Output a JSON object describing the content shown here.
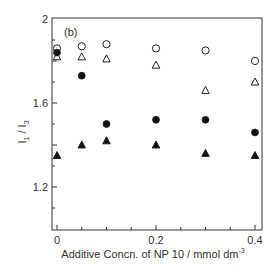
{
  "chart_data": {
    "type": "scatter",
    "panel_label": "(b)",
    "xlabel": "Additive Concn. of NP 10 / mmol dm-3",
    "xlabel_main": "Additive Concn. of NP 10 / mmol dm",
    "xlabel_sup": "-3",
    "ylabel": "I1 / I3",
    "xlim": [
      0,
      0.4
    ],
    "ylim": [
      1.0,
      2.0
    ],
    "x_ticks": [
      "0",
      "0.2",
      "0.4"
    ],
    "y_ticks": [
      "1.2",
      "1.6",
      "2"
    ],
    "grid": false,
    "legend": "none",
    "x": [
      0,
      0.05,
      0.1,
      0.2,
      0.3,
      0.4
    ],
    "series": [
      {
        "name": "open-circle",
        "marker": "circle-open",
        "values": [
          1.86,
          1.87,
          1.88,
          1.86,
          1.85,
          1.8
        ]
      },
      {
        "name": "open-triangle",
        "marker": "triangle-open",
        "values": [
          1.82,
          1.82,
          1.81,
          1.78,
          1.66,
          1.7
        ]
      },
      {
        "name": "filled-circle",
        "marker": "circle-filled",
        "values": [
          1.84,
          1.73,
          1.5,
          1.52,
          1.52,
          1.46
        ]
      },
      {
        "name": "filled-triangle",
        "marker": "triangle-filled",
        "values": [
          1.35,
          1.4,
          1.42,
          1.4,
          1.36,
          1.35
        ]
      }
    ]
  }
}
